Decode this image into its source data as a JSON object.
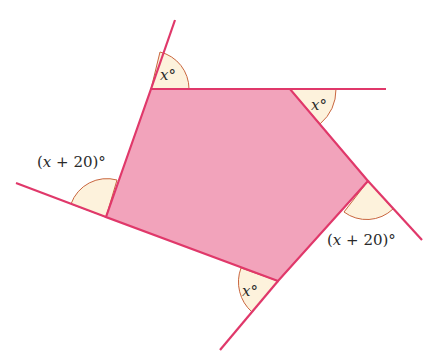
{
  "diagram": {
    "type": "pentagon-exterior-angles",
    "colors": {
      "fill": "#f2a3bb",
      "stroke": "#e0386a",
      "arc_fill": "#fdf2dc",
      "arc_stroke": "#c9663f",
      "text": "#2a2a2a"
    },
    "vertices": [
      {
        "name": "top-left",
        "x": 151,
        "y": 89
      },
      {
        "name": "top-right",
        "x": 290,
        "y": 89
      },
      {
        "name": "right",
        "x": 368,
        "y": 181
      },
      {
        "name": "bottom",
        "x": 278,
        "y": 281
      },
      {
        "name": "left",
        "x": 106,
        "y": 217
      }
    ],
    "angles": [
      {
        "vertex": "top-left",
        "label_var": "x",
        "label_suffix": "°",
        "text": "x°"
      },
      {
        "vertex": "top-right",
        "label_var": "x",
        "label_suffix": "°",
        "text": "x°"
      },
      {
        "vertex": "right",
        "label_prefix": "(",
        "label_var": "x",
        "label_suffix": " + 20)°",
        "text": "(x + 20)°"
      },
      {
        "vertex": "bottom",
        "label_var": "x",
        "label_suffix": "°",
        "text": "x°"
      },
      {
        "vertex": "left",
        "label_prefix": "(",
        "label_var": "x",
        "label_suffix": " + 20)°",
        "text": "(x + 20)°"
      }
    ]
  }
}
